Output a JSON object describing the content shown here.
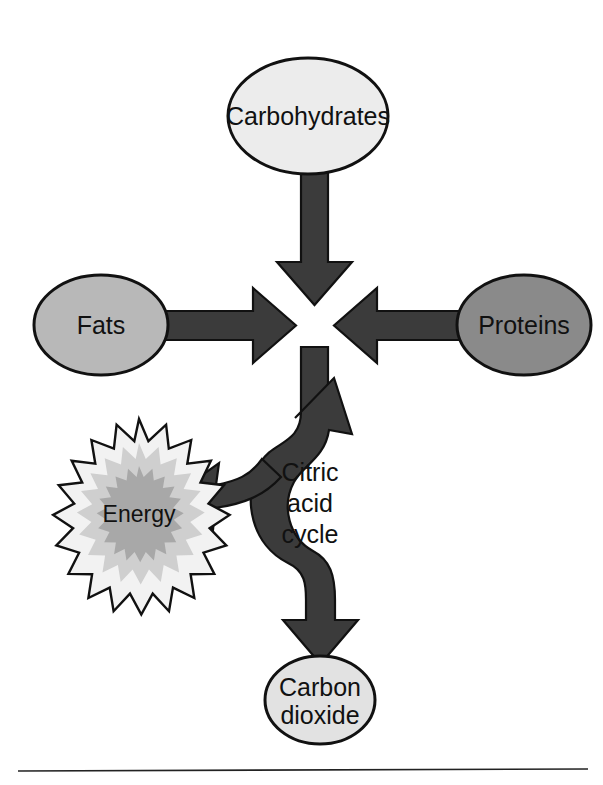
{
  "diagram": {
    "nodes": {
      "carbohydrates": {
        "label": "Carbohydrates",
        "fill": "#ececec"
      },
      "fats": {
        "label": "Fats",
        "fill": "#b8b8b8"
      },
      "proteins": {
        "label": "Proteins",
        "fill": "#8a8a8a"
      },
      "energy": {
        "label": "Energy",
        "fill_outer": "#f2f2f2",
        "fill_mid": "#cfcfcf",
        "fill_inner": "#a8a8a8"
      },
      "carbon_dioxide": {
        "label_line1": "Carbon",
        "label_line2": "dioxide",
        "fill": "#e2e2e2"
      },
      "citric_acid_cycle": {
        "label_line1": "Citric",
        "label_line2": "acid",
        "label_line3": "cycle"
      }
    },
    "arrows": {
      "carbohydrates_to_center": "arrow-down",
      "fats_to_center": "arrow-right",
      "proteins_to_center": "arrow-left",
      "center_to_cycle": "stem-down",
      "cycle_to_energy": "arrow-left",
      "cycle_loop": "arrow-up-right",
      "cycle_to_carbon_dioxide": "arrow-down"
    },
    "colors": {
      "arrow_fill": "#3b3b3b",
      "outline": "#111111",
      "background": "#ffffff",
      "rule": "#222222"
    }
  }
}
